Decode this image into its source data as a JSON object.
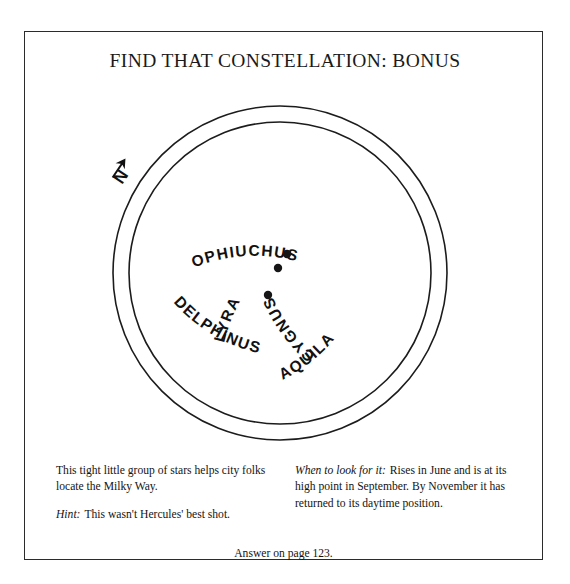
{
  "page": {
    "title": "FIND THAT CONSTELLATION: BONUS"
  },
  "star_map": {
    "north_indicator": "N",
    "ring_labels": [
      {
        "name": "lyra",
        "text": "LYRA"
      },
      {
        "name": "ophiuchus",
        "text": "OPHIUCHUS"
      },
      {
        "name": "aquila",
        "text": "AQUILA"
      },
      {
        "name": "delphinus",
        "text": "DELPHINUS"
      },
      {
        "name": "cygnus",
        "text": "CYGNUS"
      }
    ],
    "stars": [
      {
        "cx": 187,
        "cy": 161,
        "r": 4.2
      },
      {
        "cx": 178,
        "cy": 175,
        "r": 4.2
      },
      {
        "cx": 168,
        "cy": 202,
        "r": 4.2
      }
    ],
    "circle": {
      "cx": 180,
      "cy": 180,
      "outer_radius": 167,
      "inner_radius": 151
    },
    "colors": {
      "ink": "#1a1a1a",
      "line": "#1c1c1c",
      "background": "#ffffff"
    }
  },
  "captions": {
    "left": {
      "description": "This tight little group of stars helps city folks locate the Milky Way.",
      "hint_label": "Hint:",
      "hint_text": "This wasn't Hercules' best shot."
    },
    "right": {
      "when_label": "When to look for it:",
      "when_text": "Rises in June and is at its high point in September.  By November it has returned to its daytime position."
    },
    "answer": "Answer on page 123."
  }
}
